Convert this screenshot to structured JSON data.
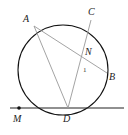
{
  "diagram": {
    "type": "geometry",
    "points": {
      "A": {
        "label": "A",
        "x": 34,
        "y": 26
      },
      "B": {
        "label": "B",
        "x": 107,
        "y": 73
      },
      "C": {
        "label": "C",
        "x": 91,
        "y": 20
      },
      "D": {
        "label": "D",
        "x": 68,
        "y": 108
      },
      "M": {
        "label": "M",
        "x": 19,
        "y": 108
      },
      "N": {
        "label": "N",
        "x": 83,
        "y": 57
      }
    },
    "circle": {
      "cx": 63,
      "cy": 70,
      "r": 45
    },
    "tangent_line": {
      "x1": 10,
      "y1": 108,
      "x2": 124,
      "y2": 108
    },
    "segments": [
      [
        "A",
        "D"
      ],
      [
        "A",
        "B"
      ],
      [
        "C",
        "D"
      ]
    ],
    "angle_mark": {
      "label": "1",
      "at": "N"
    }
  },
  "colors": {
    "circle": "#111111",
    "tangent": "#222222",
    "chords": "#999999",
    "point": "#111111"
  }
}
